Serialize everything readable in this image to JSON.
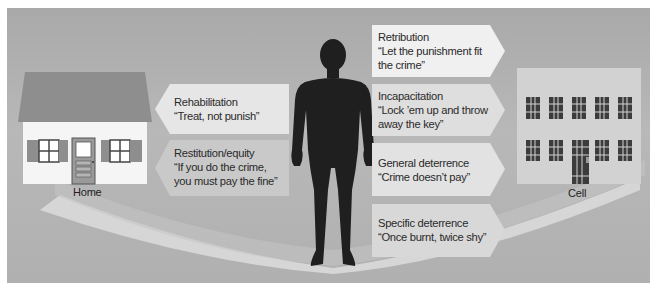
{
  "diagram": {
    "left_endpoint": {
      "label": "Home",
      "icon": "house-icon"
    },
    "right_endpoint": {
      "label": "Cell",
      "icon": "prison-icon"
    },
    "center_figure": {
      "icon": "human-silhouette-icon"
    },
    "left_arrows": [
      {
        "title": "Rehabilitation",
        "quote": "“Treat, not punish”"
      },
      {
        "title": "Restitution/equity",
        "quote_line1": "“If you do the crime,",
        "quote_line2": "you must pay the fine”"
      }
    ],
    "right_arrows": [
      {
        "title": "Retribution",
        "quote_line1": "“Let the punishment fit",
        "quote_line2": "the crime”"
      },
      {
        "title": "Incapacitation",
        "quote_line1": "“Lock ’em up and throw",
        "quote_line2": "away the key”"
      },
      {
        "title": "General deterrence",
        "quote": "“Crime doesn’t pay”"
      },
      {
        "title": "Specific deterrence",
        "quote": "“Once burnt, twice shy”"
      }
    ],
    "colors": {
      "background": "#b1b1b1",
      "arch": "#d2d2d2",
      "figure": "#1e1e1e",
      "roof": "#8a8a8a",
      "house_wall": "#f4f4f4",
      "prison_wall": "#d0d0d0",
      "bars": "#3a3a3a"
    }
  }
}
